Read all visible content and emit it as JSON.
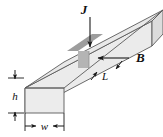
{
  "figure": {
    "kind": "hall-effect-bar-diagram",
    "background_color": "#ffffff",
    "labels": {
      "current_density": "J",
      "magnetic_field": "B",
      "length": "L",
      "height": "h",
      "width": "w"
    },
    "arrows": {
      "current_density_direction": "down",
      "magnetic_field_direction": "left",
      "length_dimension_style": "double-arrow-diagonal",
      "height_dimension_style": "double-arrow-vertical",
      "width_dimension_style": "double-arrow-horizontal"
    },
    "colors": {
      "bar_top_face": "#e8e8e8",
      "bar_front_face": "#ebebeb",
      "bar_end_face": "#dcdcdc",
      "shaded_slab_top": "#9a9a9a",
      "shaded_slab_front": "#b5b5b5",
      "outline": "#4a4a4a",
      "dimension_line": "#1a1a1a",
      "text": "#101010"
    }
  }
}
